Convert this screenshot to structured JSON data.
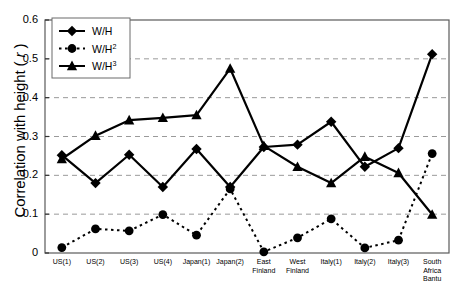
{
  "chart_data": {
    "type": "line",
    "title": "",
    "xlabel": "",
    "ylabel": "Correlation with height ( r )",
    "ylim": [
      0,
      0.6
    ],
    "yticks": [
      0,
      0.1,
      0.2,
      0.3,
      0.4,
      0.5,
      0.6
    ],
    "ytick_labels": [
      "0",
      "0.1",
      "0.2",
      "0.3",
      "0.4",
      "0.5",
      "0.6"
    ],
    "grid": "horizontal-dashed",
    "legend_position": "top-left",
    "categories": [
      "US(1)",
      "US(2)",
      "US(3)",
      "US(4)",
      "Japan(1)",
      "Japan(2)",
      "East\nFinland",
      "West\nFinland",
      "Italy(1)",
      "Italy(2)",
      "Italy(3)",
      "South\nAfrica\nBantu"
    ],
    "series": [
      {
        "name": "W/H",
        "marker": "diamond",
        "line": "solid",
        "color": "#000000",
        "values": [
          0.252,
          0.18,
          0.253,
          0.17,
          0.268,
          0.17,
          0.273,
          0.279,
          0.338,
          0.222,
          0.27,
          0.512
        ]
      },
      {
        "name": "W/H2",
        "label_base": "W/H",
        "label_exp": "2",
        "marker": "circle",
        "line": "dashed",
        "color": "#000000",
        "values": [
          0.014,
          0.062,
          0.057,
          0.099,
          0.046,
          0.165,
          0.003,
          0.039,
          0.088,
          0.013,
          0.033,
          0.256
        ]
      },
      {
        "name": "W/H3",
        "label_base": "W/H",
        "label_exp": "3",
        "marker": "triangle",
        "line": "solid",
        "color": "#000000",
        "values": [
          0.242,
          0.302,
          0.342,
          0.348,
          0.355,
          0.475,
          0.276,
          0.222,
          0.18,
          0.248,
          0.206,
          0.099
        ]
      }
    ]
  },
  "legend": {
    "items": [
      {
        "base": "W/H",
        "exp": ""
      },
      {
        "base": "W/H",
        "exp": "2"
      },
      {
        "base": "W/H",
        "exp": "3"
      }
    ]
  }
}
